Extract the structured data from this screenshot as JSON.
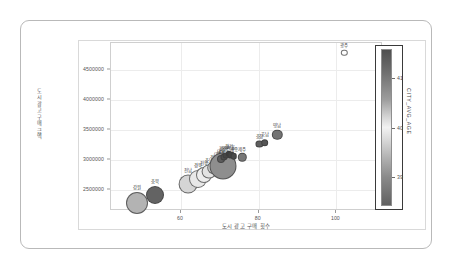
{
  "chart_data": {
    "type": "scatter",
    "title": "",
    "xlabel": "도시 광고 구매 횟수",
    "ylabel": "도시 광고 구매 금액",
    "xlim": [
      42,
      112
    ],
    "ylim": [
      2150000,
      4950000
    ],
    "grid": true,
    "x_ticks": [
      "60",
      "80",
      "100"
    ],
    "x_tick_values": [
      60,
      80,
      100
    ],
    "y_ticks": [
      "2500000",
      "3000000",
      "3500000",
      "4000000",
      "4500000"
    ],
    "y_tick_values": [
      2500000,
      3000000,
      3500000,
      4000000,
      4500000
    ],
    "size_encoding": "bubble area",
    "color_encoding": "CITY_AVG_AGE",
    "colorbar": {
      "label": "CITY_AVG_AGE",
      "ticks": [
        "41",
        "40",
        "39"
      ],
      "tick_values": [
        41,
        40,
        39
      ],
      "vmin": 38.4,
      "vmax": 41.6,
      "position": "right",
      "orientation": "vertical",
      "colormap": "grayscale-diverging"
    },
    "points": [
      {
        "label": "강원",
        "x": 48.6,
        "y": 2290000,
        "size": 11.0,
        "color": "#b3b3b3"
      },
      {
        "label": "충북",
        "x": 53.2,
        "y": 2425000,
        "size": 9.0,
        "color": "#636363"
      },
      {
        "label": "전남",
        "x": 61.8,
        "y": 2600000,
        "size": 9.4,
        "color": "#d5d5d5"
      },
      {
        "label": "경북",
        "x": 64.4,
        "y": 2690000,
        "size": 9.0,
        "color": "#e8e8e8"
      },
      {
        "label": "전북",
        "x": 66.0,
        "y": 2750000,
        "size": 8.0,
        "color": "#ededed"
      },
      {
        "label": "충남",
        "x": 67.2,
        "y": 2805000,
        "size": 7.4,
        "color": "#e3e3e3"
      },
      {
        "label": "경남",
        "x": 68.6,
        "y": 2870000,
        "size": 6.8,
        "color": "#d0d0d0"
      },
      {
        "label": "대전",
        "x": 69.6,
        "y": 2915000,
        "size": 6.4,
        "color": "#dedede"
      },
      {
        "label": "광주",
        "x": 70.4,
        "y": 2945000,
        "size": 5.6,
        "color": "#cfcfcf"
      },
      {
        "label": "울산",
        "x": 70.9,
        "y": 2900000,
        "size": 13.5,
        "color": "#8e8e8e"
      },
      {
        "label": "대구",
        "x": 70.2,
        "y": 3010000,
        "size": 4.0,
        "color": "#5c5c5c"
      },
      {
        "label": "부산",
        "x": 71.0,
        "y": 3050000,
        "size": 3.6,
        "color": "#4c4c4c"
      },
      {
        "label": "인천",
        "x": 71.6,
        "y": 3075000,
        "size": 3.4,
        "color": "#454545"
      },
      {
        "label": "경기",
        "x": 72.3,
        "y": 3100000,
        "size": 3.2,
        "color": "#3c3c3c"
      },
      {
        "label": "서울",
        "x": 72.9,
        "y": 3085000,
        "size": 3.4,
        "color": "#424242"
      },
      {
        "label": "세종",
        "x": 73.6,
        "y": 3060000,
        "size": 3.2,
        "color": "#4a4a4a"
      },
      {
        "label": "제주",
        "x": 75.8,
        "y": 3045000,
        "size": 4.2,
        "color": "#777777"
      },
      {
        "label": "충청",
        "x": 80.2,
        "y": 3270000,
        "size": 3.6,
        "color": "#5e5e5e"
      },
      {
        "label": "호남",
        "x": 81.6,
        "y": 3290000,
        "size": 3.8,
        "color": "#565656"
      },
      {
        "label": "영남",
        "x": 84.8,
        "y": 3420000,
        "size": 5.2,
        "color": "#737373"
      },
      {
        "label": "광주",
        "x": 102.0,
        "y": 4790000,
        "size": 3.2,
        "color": "#ffffff"
      }
    ]
  },
  "axes": {
    "y_title": "도시 광고 구매 금액",
    "x_title": "도시 광고 구매 횟수"
  },
  "colorbar": {
    "title": "CITY_AVG_AGE"
  },
  "footer": {
    "artifact_text": ""
  }
}
